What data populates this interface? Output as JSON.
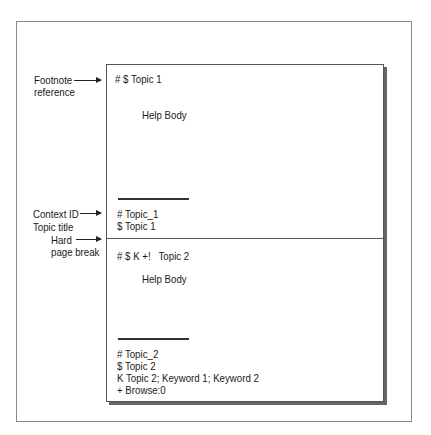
{
  "diagram": {
    "labels": {
      "footnote_reference": [
        "Footnote",
        "reference"
      ],
      "context_id": "Context ID",
      "topic_title": "Topic title",
      "hard_page_break": [
        "Hard",
        "page break"
      ]
    },
    "topic1": {
      "heading": "# $ Topic 1",
      "body": "Help Body",
      "footnotes": [
        "# Topic_1",
        "$ Topic 1"
      ]
    },
    "topic2": {
      "heading": "# $ K +!   Topic 2",
      "body": "Help Body",
      "footnotes": [
        "# Topic_2",
        "$ Topic 2",
        "K Topic 2; Keyword 1; Keyword 2",
        "+ Browse:0"
      ]
    }
  }
}
